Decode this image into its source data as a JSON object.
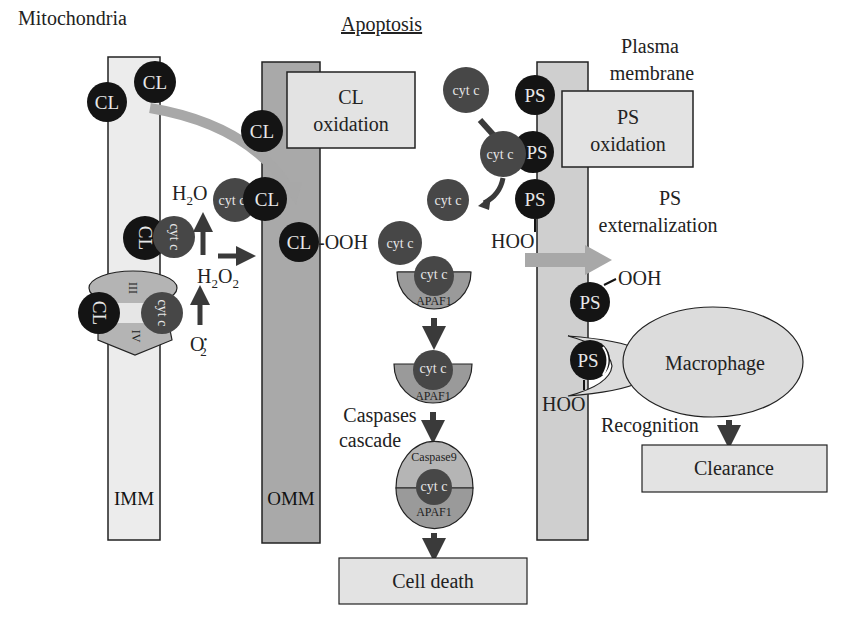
{
  "title": "Apoptosis",
  "sections": {
    "mitochondria": "Mitochondria",
    "plasma_membrane": [
      "Plasma",
      "membrane"
    ]
  },
  "membranes": {
    "imm": "IMM",
    "omm": "OMM"
  },
  "boxes": {
    "cl_oxidation": [
      "CL",
      "oxidation"
    ],
    "ps_oxidation": [
      "PS",
      "oxidation"
    ],
    "cell_death": "Cell death",
    "clearance": "Clearance"
  },
  "molecules": {
    "cl": "CL",
    "ps": "PS",
    "cyt_c": "cyt c",
    "apaf1": "APAF1",
    "caspase9": "Caspase9",
    "complex_iii": "III",
    "complex_iv": "IV",
    "ooh": "OOH",
    "hoo": "HOO",
    "cl_ooh": "-OOH"
  },
  "chemistry": {
    "h2o": "H",
    "h2o_sub": "2",
    "h2o_tail": "O",
    "h2o2_a": "H",
    "h2o2_sub1": "2",
    "h2o2_b": "O",
    "h2o2_sub2": "2",
    "superoxide": "O",
    "superoxide_sup": "•",
    "superoxide_sub": "2"
  },
  "labels": {
    "ps_externalization": [
      "PS",
      "externalization"
    ],
    "caspases_cascade": [
      "Caspases",
      "cascade"
    ],
    "macrophage": "Macrophage",
    "recognition": "Recognition"
  },
  "colors": {
    "cl_fill": "#141414",
    "cyt_c_fill": "#474747",
    "imm_fill": "#ececec",
    "omm_fill": "#a9a9a9",
    "pm_fill": "#cfcfcf",
    "box_fill": "#e3e3e3",
    "apaf_fill": "#9a9a9a",
    "caspase_fill": "#b5b5b5",
    "arrow_dark": "#3a3a3a",
    "arrow_light": "#a8a8a8",
    "macrophage_fill": "#dcdcdc"
  }
}
